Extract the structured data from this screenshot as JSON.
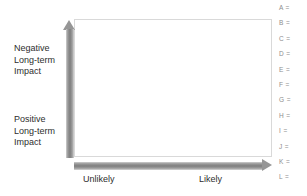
{
  "chart_data": {
    "type": "scatter",
    "title": "",
    "subtitle": "",
    "xlabel": "",
    "ylabel": "",
    "grid": false,
    "legend_position": "right",
    "x_axis": {
      "type": "qualitative",
      "arrow": "right",
      "tick_labels": [
        "Unlikely",
        "Likely"
      ],
      "range_low_label": "Unlikely",
      "range_high_label": "Likely"
    },
    "y_axis": {
      "type": "qualitative",
      "arrow": "up",
      "tick_labels": [
        "Positive Long-term Impact",
        "Negative Long-term Impact"
      ],
      "range_low_label": "Positive Long-term Impact",
      "range_high_label": "Negative Long-term Impact"
    },
    "series": [],
    "values": [],
    "categories": [],
    "annotations": []
  },
  "axes": {
    "y_top": {
      "line1": "Negative",
      "line2": "Long-term",
      "line3": "Impact"
    },
    "y_bottom": {
      "line1": "Positive",
      "line2": "Long-term",
      "line3": "Impact"
    },
    "x_left_label": "Unlikely",
    "x_right_label": "Likely"
  },
  "legend": {
    "items": [
      {
        "key": "A",
        "text": "A ="
      },
      {
        "key": "B",
        "text": "B ="
      },
      {
        "key": "C",
        "text": "C ="
      },
      {
        "key": "D",
        "text": "D ="
      },
      {
        "key": "E",
        "text": "E ="
      },
      {
        "key": "F",
        "text": "F ="
      },
      {
        "key": "G",
        "text": "G ="
      },
      {
        "key": "H",
        "text": "H ="
      },
      {
        "key": "I",
        "text": "I ="
      },
      {
        "key": "J",
        "text": "J ="
      },
      {
        "key": "K",
        "text": "K ="
      },
      {
        "key": "L",
        "text": "L ="
      }
    ]
  },
  "colors": {
    "background": "#ffffff",
    "arrow_gray": "#8a8a8a",
    "plot_border": "#d9d9d9",
    "axis_text": "#2e2e2e",
    "legend_text": "#8d8d8d"
  }
}
